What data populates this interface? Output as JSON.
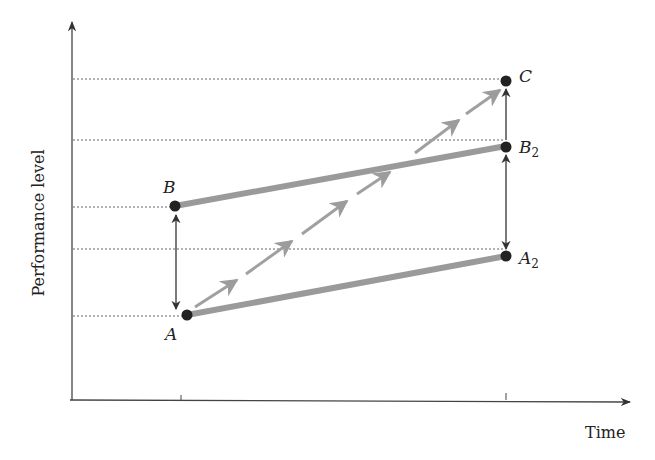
{
  "figure": {
    "type": "diagram",
    "title": "",
    "axes": {
      "x_label": "Time",
      "y_label": "Performance level"
    },
    "points": [
      {
        "id": "A",
        "label": "A",
        "sub": ""
      },
      {
        "id": "B",
        "label": "B",
        "sub": ""
      },
      {
        "id": "A2",
        "label": "A",
        "sub": "2"
      },
      {
        "id": "B2",
        "label": "B",
        "sub": "2"
      },
      {
        "id": "C",
        "label": "C",
        "sub": ""
      }
    ],
    "connections": [
      {
        "from": "A",
        "to": "A2",
        "style": "thick-gray"
      },
      {
        "from": "B",
        "to": "B2",
        "style": "thick-gray"
      },
      {
        "from": "A",
        "to": "C",
        "style": "dashed-arrows"
      },
      {
        "from": "A",
        "to": "B",
        "style": "double-arrow"
      },
      {
        "from": "A2",
        "to": "B2",
        "style": "double-arrow"
      },
      {
        "from": "B2",
        "to": "C",
        "style": "arrow"
      }
    ],
    "colors": {
      "axis": "#444444",
      "point": "#222222",
      "thick_line": "#9a9a9a",
      "dashed_arrow": "#a0a0a0",
      "guide": "#666666"
    }
  }
}
